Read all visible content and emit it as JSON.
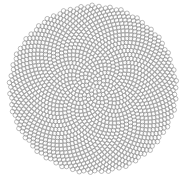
{
  "diagram": {
    "type": "phyllotaxis-spiral",
    "background": "#ffffff",
    "stroke_color": "#8c8c8c",
    "fill_color": "none",
    "center": [
      93,
      89
    ],
    "outer_radius": 84,
    "point_count": 1500,
    "dot_radius": 2.3,
    "stroke_width": 0.6,
    "golden_angle_deg": 137.508
  }
}
